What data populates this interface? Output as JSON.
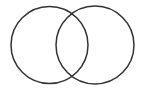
{
  "diagram": {
    "type": "venn",
    "set_count": 2,
    "labels": [],
    "stroke_color": "#333333",
    "fill_color": "none",
    "background": "#ffffff",
    "circles": [
      {
        "name": "set-a",
        "cx": 49.5,
        "cy": 45,
        "r": 38.5
      },
      {
        "name": "set-b",
        "cx": 95,
        "cy": 45,
        "r": 39
      }
    ]
  }
}
